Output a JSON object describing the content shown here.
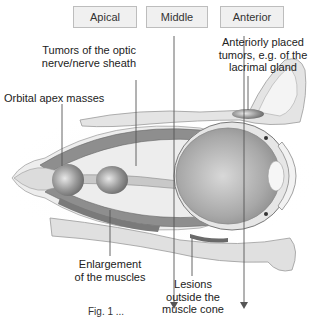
{
  "zones": [
    {
      "label": "Apical"
    },
    {
      "label": "Middle"
    },
    {
      "label": "Anterior"
    }
  ],
  "annotations": {
    "optic_nerve_tumors": [
      "Tumors of the optic",
      "nerve/nerve sheath"
    ],
    "orbital_apex": "Orbital apex masses",
    "anterior_tumors": [
      "Anteriorly placed",
      "tumors, e.g. of the",
      "lacrimal gland"
    ],
    "muscle_enlargement": [
      "Enlargement",
      "of the muscles"
    ],
    "extraconal_lesions": [
      "Lesions",
      "outside the",
      "muscle cone"
    ]
  },
  "caption": "Fig. 1 ...",
  "colors": {
    "box_fill": "#f0f0f0",
    "box_border": "#bdbdbd",
    "leader_line": "#555555",
    "muscle": "#8a8a8a",
    "globe": "#9a9a9a",
    "bone": "#d8d8d8"
  }
}
